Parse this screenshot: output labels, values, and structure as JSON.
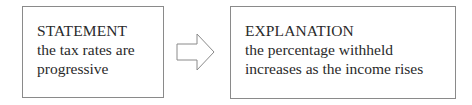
{
  "statement": {
    "heading": "STATEMENT",
    "lines": [
      "the tax rates are",
      "progressive"
    ]
  },
  "explanation": {
    "heading": "EXPLANATION",
    "lines": [
      "the percentage withheld",
      "increases as the income rises"
    ]
  },
  "arrow": {
    "icon": "right-arrow-outline-icon",
    "stroke": "#8a8a8a"
  }
}
